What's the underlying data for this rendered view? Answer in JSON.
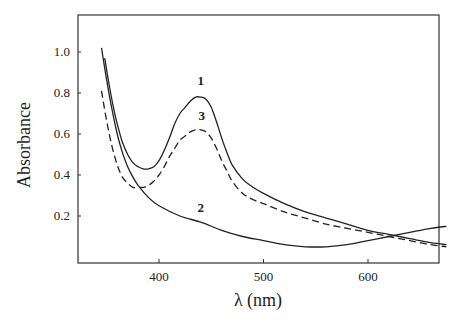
{
  "chart_data": {
    "type": "line",
    "title": "",
    "xlabel": "λ (nm)",
    "ylabel": "Absorbance",
    "xlim": [
      335,
      680
    ],
    "ylim": [
      -0.02,
      1.2
    ],
    "x_ticks": [
      400,
      500,
      600
    ],
    "y_ticks": [
      0.2,
      0.4,
      0.6,
      0.8,
      1.0
    ],
    "x_tick_labels": [
      "400",
      "500",
      "600"
    ],
    "y_tick_labels": [
      "0.2",
      "0.4",
      "0.6",
      "0.8",
      "1.0"
    ],
    "grid": false,
    "legend": "inline curve labels",
    "series": [
      {
        "name": "1",
        "style": "solid",
        "label_pos": [
          440,
          0.84
        ],
        "x": [
          348,
          352,
          356,
          360,
          365,
          370,
          375,
          380,
          385,
          390,
          395,
          400,
          405,
          410,
          415,
          420,
          425,
          430,
          435,
          440,
          445,
          450,
          455,
          460,
          465,
          470,
          480,
          490,
          500,
          520,
          540,
          560,
          580,
          600,
          620,
          640,
          660,
          675
        ],
        "y": [
          0.97,
          0.85,
          0.74,
          0.65,
          0.56,
          0.5,
          0.46,
          0.44,
          0.43,
          0.43,
          0.44,
          0.47,
          0.52,
          0.58,
          0.65,
          0.7,
          0.73,
          0.76,
          0.78,
          0.78,
          0.77,
          0.73,
          0.66,
          0.58,
          0.51,
          0.45,
          0.38,
          0.34,
          0.31,
          0.26,
          0.22,
          0.19,
          0.16,
          0.13,
          0.11,
          0.09,
          0.07,
          0.06
        ]
      },
      {
        "name": "2",
        "style": "solid",
        "label_pos": [
          440,
          0.22
        ],
        "x": [
          345,
          350,
          355,
          360,
          365,
          370,
          375,
          380,
          390,
          400,
          420,
          440,
          460,
          480,
          500,
          520,
          540,
          560,
          580,
          600,
          620,
          640,
          660,
          675
        ],
        "y": [
          1.02,
          0.86,
          0.72,
          0.6,
          0.51,
          0.44,
          0.39,
          0.35,
          0.29,
          0.25,
          0.2,
          0.17,
          0.13,
          0.1,
          0.08,
          0.06,
          0.05,
          0.05,
          0.06,
          0.08,
          0.1,
          0.12,
          0.14,
          0.15
        ]
      },
      {
        "name": "3",
        "style": "dashed",
        "label_pos": [
          441,
          0.67
        ],
        "x": [
          345,
          350,
          355,
          360,
          365,
          370,
          375,
          380,
          385,
          390,
          395,
          400,
          405,
          410,
          415,
          420,
          425,
          430,
          435,
          440,
          445,
          450,
          455,
          460,
          465,
          470,
          480,
          490,
          500,
          520,
          540,
          560,
          580,
          600,
          620,
          640,
          660,
          675
        ],
        "y": [
          0.81,
          0.66,
          0.54,
          0.45,
          0.39,
          0.36,
          0.34,
          0.34,
          0.34,
          0.35,
          0.37,
          0.4,
          0.44,
          0.49,
          0.53,
          0.57,
          0.59,
          0.61,
          0.62,
          0.62,
          0.61,
          0.58,
          0.53,
          0.47,
          0.42,
          0.37,
          0.31,
          0.28,
          0.26,
          0.22,
          0.19,
          0.16,
          0.14,
          0.12,
          0.1,
          0.08,
          0.06,
          0.05
        ]
      }
    ]
  },
  "labels": {
    "xlabel": "λ (nm)",
    "ylabel": "Absorbance"
  }
}
